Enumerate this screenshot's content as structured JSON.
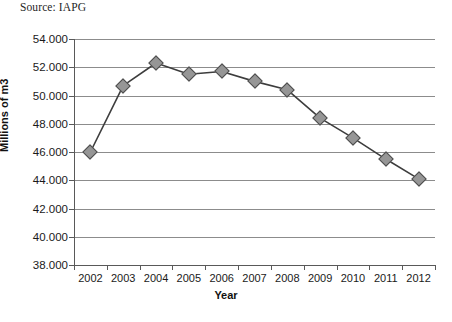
{
  "figure": {
    "source_note": "Source: IAPG"
  },
  "chart_data": {
    "type": "line",
    "title": "",
    "xlabel": "Year",
    "ylabel": "Millions of m3",
    "categories": [
      "2002",
      "2003",
      "2004",
      "2005",
      "2006",
      "2007",
      "2008",
      "2009",
      "2010",
      "2011",
      "2012"
    ],
    "values": [
      46000,
      50700,
      52300,
      51500,
      51700,
      51000,
      50400,
      48400,
      47000,
      45500,
      44100
    ],
    "value_labels": [
      "46.000",
      "50.700",
      "52.300",
      "51.500",
      "51.700",
      "51.000",
      "50.400",
      "48.400",
      "47.000",
      "45.500",
      "44.100"
    ],
    "ylim": [
      38000,
      54000
    ],
    "ytick_values": [
      54000,
      52000,
      50000,
      48000,
      46000,
      44000,
      42000,
      40000,
      38000
    ],
    "ytick_labels": [
      "54.000",
      "52.000",
      "50.000",
      "48.000",
      "46.000",
      "44.000",
      "42.000",
      "40.000",
      "38.000"
    ],
    "grid": "horizontal",
    "legend": "none",
    "marker": "diamond",
    "colors": {
      "line": "#3d3d3d",
      "marker_fill": "#969696",
      "marker_edge": "#4d4d4d",
      "gridline": "#8c8c8c",
      "axis": "#595959",
      "text": "#1a1a1a",
      "background": "#ffffff"
    }
  }
}
